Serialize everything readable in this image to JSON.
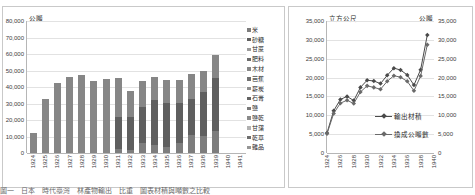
{
  "page": {
    "caption": "圖一　日本　時代臺灣　林產物輸出　比重　圖表材積與噸數之比較"
  },
  "chart_data": [
    {
      "id": "export-commodities-stacked-bar",
      "type": "bar",
      "stacked": true,
      "title": "",
      "ylabel": "公噸",
      "xlabel": "",
      "ylim": [
        0,
        80000
      ],
      "ytick_labels": [
        "80,000",
        "70,000",
        "60,000",
        "50,000",
        "40,000",
        "30,000",
        "20,000",
        "10,000",
        "0"
      ],
      "ytick_values": [
        80000,
        70000,
        60000,
        50000,
        40000,
        30000,
        20000,
        10000,
        0
      ],
      "grid": true,
      "legend_position": "right",
      "categories": [
        "1924",
        "1925",
        "1926",
        "1927",
        "1928",
        "1929",
        "1930",
        "1931",
        "1932",
        "1933",
        "1934",
        "1935",
        "1936",
        "1937",
        "1938",
        "1939",
        "1940",
        "1941"
      ],
      "series": [
        {
          "name": "米",
          "color": "#7d7d7d",
          "values": [
            0,
            0,
            0,
            0,
            0,
            0,
            0,
            2200,
            2100,
            6000,
            4600,
            3900,
            6100,
            10900,
            10600,
            13400,
            0,
            0
          ]
        },
        {
          "name": "砂糖",
          "color": "#5f5f5f",
          "values": [
            0,
            0,
            0,
            0,
            0,
            0,
            0,
            19800,
            19600,
            21900,
            27800,
            26700,
            24500,
            21800,
            26200,
            32000,
            0,
            0
          ]
        },
        {
          "name": "甘蔗",
          "color": "#9a9a9a",
          "values": [
            0,
            0,
            0,
            0,
            0,
            0,
            0,
            0,
            0,
            0,
            0,
            0,
            0,
            0,
            0,
            0,
            0,
            0
          ]
        },
        {
          "name": "肥料",
          "color": "#6b6b6b",
          "values": [
            0,
            0,
            0,
            0,
            0,
            0,
            0,
            0,
            0,
            0,
            0,
            0,
            0,
            0,
            0,
            0,
            0,
            0
          ]
        },
        {
          "name": "木材",
          "color": "#868686",
          "values": [
            12000,
            32800,
            42300,
            45800,
            47000,
            43700,
            44600,
            23200,
            15600,
            15800,
            13400,
            13700,
            13500,
            15100,
            12900,
            14300,
            0,
            0
          ]
        },
        {
          "name": "芭蕉",
          "color": "#717171",
          "values": [
            0,
            0,
            0,
            0,
            0,
            0,
            0,
            0,
            0,
            0,
            0,
            0,
            0,
            0,
            0,
            0,
            0,
            0
          ]
        },
        {
          "name": "薪炭",
          "color": "#8f8f8f",
          "values": [
            0,
            0,
            0,
            0,
            0,
            0,
            0,
            0,
            0,
            0,
            0,
            0,
            0,
            0,
            0,
            0,
            0,
            0
          ]
        },
        {
          "name": "石膏",
          "color": "#636363",
          "values": [
            0,
            0,
            0,
            0,
            0,
            0,
            0,
            0,
            0,
            0,
            0,
            0,
            0,
            0,
            0,
            0,
            0,
            0
          ]
        },
        {
          "name": "鹽",
          "color": "#7a7a7a",
          "values": [
            0,
            0,
            0,
            0,
            0,
            0,
            0,
            0,
            0,
            0,
            0,
            0,
            0,
            0,
            0,
            0,
            0,
            0
          ]
        },
        {
          "name": "鹽乾",
          "color": "#8a8a8a",
          "values": [
            0,
            0,
            0,
            0,
            0,
            0,
            0,
            0,
            0,
            0,
            0,
            0,
            0,
            0,
            0,
            0,
            0,
            0
          ]
        },
        {
          "name": "甘藷",
          "color": "#b2b2b2",
          "values": [
            0,
            0,
            0,
            0,
            0,
            0,
            0,
            0,
            0,
            0,
            0,
            0,
            0,
            0,
            0,
            0,
            0,
            0
          ]
        },
        {
          "name": "乾草",
          "color": "#6e6e6e",
          "values": [
            0,
            0,
            0,
            0,
            0,
            0,
            0,
            0,
            0,
            0,
            0,
            0,
            0,
            0,
            0,
            0,
            0,
            0
          ]
        },
        {
          "name": "雜品",
          "color": "#969696",
          "values": [
            0,
            0,
            0,
            0,
            0,
            0,
            0,
            0,
            0,
            0,
            0,
            0,
            0,
            0,
            0,
            0,
            0,
            0
          ]
        }
      ],
      "totals": [
        12000,
        32800,
        42300,
        45800,
        47000,
        43700,
        44600,
        45200,
        37300,
        43700,
        45800,
        44300,
        44100,
        47800,
        49700,
        59700,
        0,
        0
      ]
    },
    {
      "id": "timber-volume-vs-tonnage-line",
      "type": "line",
      "title": "",
      "ylabel_left": "立方公尺",
      "ylabel_right": "公噸",
      "xlabel": "",
      "ylim": [
        0,
        35000
      ],
      "ytick_labels": [
        "35,000",
        "30,000",
        "25,000",
        "20,000",
        "15,000",
        "10,000",
        "5,000",
        "0"
      ],
      "ytick_values": [
        35000,
        30000,
        25000,
        20000,
        15000,
        10000,
        5000,
        0
      ],
      "grid": true,
      "legend_position": "inside-center",
      "x": [
        "1924",
        "1925",
        "1926",
        "1927",
        "1928",
        "1929",
        "1930",
        "1931",
        "1932",
        "1933",
        "1934",
        "1935",
        "1936",
        "1937",
        "1938",
        "1939",
        "1940"
      ],
      "xtick_labels": [
        "1924",
        "1926",
        "1928",
        "1930",
        "1932",
        "1934",
        "1936",
        "1938",
        "1940"
      ],
      "series": [
        {
          "name": "輸出材積",
          "color": "#4a4a4a",
          "values": [
            5300,
            11200,
            14200,
            15000,
            13900,
            17400,
            19300,
            19100,
            18400,
            20600,
            22500,
            22000,
            20700,
            18000,
            22100,
            31300,
            null
          ]
        },
        {
          "name": "換成公噸數",
          "color": "#6a6a6a",
          "values": [
            5100,
            10500,
            13200,
            14000,
            13100,
            16200,
            17800,
            17400,
            16900,
            19000,
            20500,
            20100,
            19000,
            16500,
            20400,
            28700,
            null
          ]
        }
      ]
    }
  ]
}
